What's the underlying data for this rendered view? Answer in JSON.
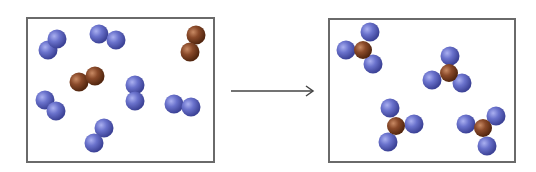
{
  "diagram": {
    "type": "chemical-reaction-particle-diagram",
    "colors": {
      "blue_atom": "#6a72cc",
      "brown_atom": "#8a4a2a",
      "border": "#6a6a6a",
      "arrow": "#444444"
    },
    "reactants_box": {
      "x": 26,
      "y": 17,
      "w": 189,
      "h": 146,
      "molecules": [
        {
          "type": "diatomic",
          "color": "blue",
          "atoms": [
            [
              48,
              50
            ],
            [
              57,
              39
            ]
          ]
        },
        {
          "type": "diatomic",
          "color": "blue",
          "atoms": [
            [
              99,
              34
            ],
            [
              116,
              40
            ]
          ]
        },
        {
          "type": "diatomic",
          "color": "brown",
          "atoms": [
            [
              196,
              35
            ],
            [
              190,
              52
            ]
          ]
        },
        {
          "type": "diatomic",
          "color": "brown",
          "atoms": [
            [
              79,
              82
            ],
            [
              95,
              76
            ]
          ]
        },
        {
          "type": "diatomic",
          "color": "blue",
          "atoms": [
            [
              135,
              85
            ],
            [
              135,
              101
            ]
          ]
        },
        {
          "type": "diatomic",
          "color": "blue",
          "atoms": [
            [
              45,
              100
            ],
            [
              56,
              111
            ]
          ]
        },
        {
          "type": "diatomic",
          "color": "blue",
          "atoms": [
            [
              174,
              104
            ],
            [
              191,
              107
            ]
          ]
        },
        {
          "type": "diatomic",
          "color": "blue",
          "atoms": [
            [
              104,
              128
            ],
            [
              94,
              143
            ]
          ]
        }
      ]
    },
    "arrow": {
      "x1": 231,
      "y1": 91,
      "x2": 313,
      "y2": 91
    },
    "products_box": {
      "x": 328,
      "y": 18,
      "w": 188,
      "h": 145,
      "molecules": [
        {
          "type": "NH3-like",
          "center": [
            363,
            50
          ],
          "blue": [
            [
              370,
              32
            ],
            [
              346,
              50
            ],
            [
              373,
              64
            ]
          ]
        },
        {
          "type": "NH3-like",
          "center": [
            449,
            73
          ],
          "blue": [
            [
              450,
              56
            ],
            [
              432,
              80
            ],
            [
              462,
              83
            ]
          ]
        },
        {
          "type": "NH3-like",
          "center": [
            396,
            126
          ],
          "blue": [
            [
              390,
              108
            ],
            [
              414,
              124
            ],
            [
              388,
              142
            ]
          ]
        },
        {
          "type": "NH3-like",
          "center": [
            483,
            128
          ],
          "blue": [
            [
              496,
              116
            ],
            [
              466,
              124
            ],
            [
              487,
              146
            ]
          ]
        }
      ]
    }
  }
}
